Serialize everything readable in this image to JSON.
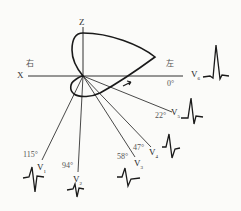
{
  "title": "",
  "axes": {
    "x_label": "X",
    "z_label": "Z",
    "right_label": "右",
    "left_label": "左",
    "zero_angle": "0°"
  },
  "leads": [
    {
      "id": "V1",
      "name": "V",
      "sub": "1",
      "angle": "115°"
    },
    {
      "id": "V2",
      "name": "V",
      "sub": "2",
      "angle": "94°"
    },
    {
      "id": "V3",
      "name": "V",
      "sub": "3",
      "angle": "58°"
    },
    {
      "id": "V4",
      "name": "V",
      "sub": "4",
      "angle": "47°"
    },
    {
      "id": "V5",
      "name": "V",
      "sub": "5",
      "angle": "22°"
    },
    {
      "id": "V6",
      "name": "V",
      "sub": "6",
      "angle": "0°"
    }
  ],
  "colors": {
    "ink": "#1a1a1a",
    "background": "#fbfbf9"
  }
}
